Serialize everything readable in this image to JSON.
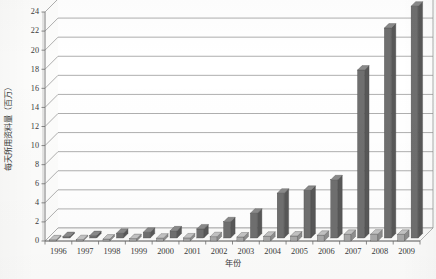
{
  "chart_data": {
    "type": "bar",
    "title": "",
    "subtitle": "",
    "xlabel": "年份",
    "ylabel": "每天所用资料量（百万）",
    "categories": [
      "1996",
      "1997",
      "1998",
      "1999",
      "2000",
      "2001",
      "2002",
      "2003",
      "2004",
      "2005",
      "2006",
      "2007",
      "2008",
      "2009"
    ],
    "ylim": [
      0,
      24
    ],
    "ytick_step": 2,
    "yticks": [
      "0",
      "2",
      "4",
      "6",
      "8",
      "10",
      "12",
      "14",
      "16",
      "18",
      "20",
      "22",
      "24"
    ],
    "grid": true,
    "legend": "none",
    "style": "3d-clustered-bar-grayscale",
    "series": [
      {
        "name": "front-series",
        "color": "#a9a9a9",
        "values": [
          0.12,
          0.14,
          0.2,
          0.25,
          0.3,
          0.32,
          0.45,
          0.42,
          0.5,
          0.52,
          0.6,
          0.7,
          0.72,
          0.7
        ]
      },
      {
        "name": "back-series",
        "color": "#6f6f6f",
        "values": [
          0.15,
          0.25,
          0.5,
          0.6,
          0.75,
          0.95,
          1.7,
          2.6,
          4.7,
          5.0,
          6.1,
          17.6,
          22.0,
          24.3
        ]
      }
    ]
  },
  "colors": {
    "front_bar": "#a9a9a9",
    "front_bar_side": "#8e8e8e",
    "front_bar_top": "#c2c2c2",
    "back_bar": "#6f6f6f",
    "back_bar_side": "#585858",
    "back_bar_top": "#8a8a8a",
    "grid": "#8c8c8c",
    "axis": "#6e6e6e",
    "text": "#3a3a3a",
    "background": "#fcfcfb"
  }
}
